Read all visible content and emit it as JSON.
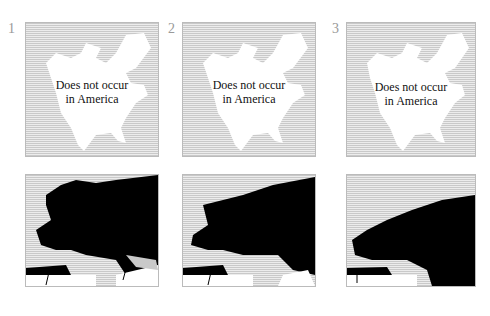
{
  "figure": {
    "panels": [
      {
        "number": "1",
        "america_label_line1": "Does not occur",
        "america_label_line2": "in America"
      },
      {
        "number": "2",
        "america_label_line1": "Does not occur",
        "america_label_line2": "in America"
      },
      {
        "number": "3",
        "america_label_line1": "Does not occur",
        "america_label_line2": "in America"
      }
    ],
    "colors": {
      "range": "#000000",
      "land": "#ffffff",
      "sea_hatch": "#c9c9c9"
    }
  }
}
